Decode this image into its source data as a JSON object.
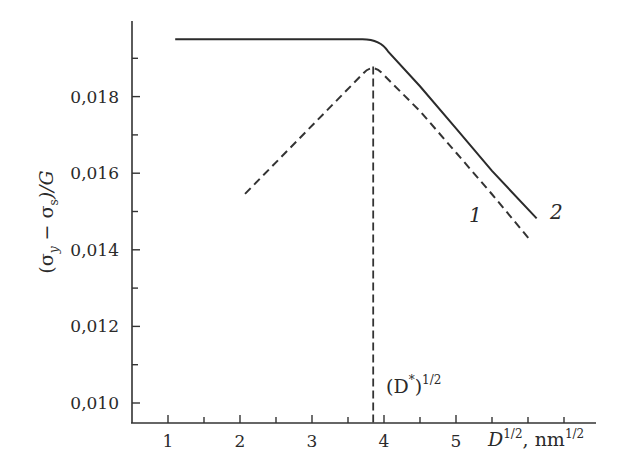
{
  "chart_data": {
    "type": "line",
    "title": "",
    "xlabel": "D^{1/2}, nm^{1/2}",
    "xlabel_parts": {
      "main": "D",
      "main_sup": "1/2",
      "sep": ", nm",
      "unit_sup": "1/2"
    },
    "ylabel": "(σ_y − σ_s)/G",
    "ylabel_parts": {
      "open": "(σ",
      "sub1": "y",
      "minus": " − σ",
      "sub2": "s",
      "close": ")/G"
    },
    "xlim": [
      0.5,
      6.9
    ],
    "ylim": [
      0.0095,
      0.0199
    ],
    "x_ticks": [
      1,
      2,
      3,
      4,
      5
    ],
    "x_tick_labels": [
      "1",
      "2",
      "3",
      "4",
      "5"
    ],
    "x_minor_ticks": [
      1.5,
      2.5,
      3.5,
      4.5,
      5.5,
      6.0,
      6.5
    ],
    "y_ticks": [
      0.01,
      0.012,
      0.014,
      0.016,
      0.018
    ],
    "y_tick_labels": [
      "0,010",
      "0,012",
      "0,014",
      "0,016",
      "0,018"
    ],
    "y_minor_ticks": [
      0.011,
      0.013,
      0.015,
      0.017,
      0.019
    ],
    "grid": false,
    "legend": "none (inline curve labels)",
    "series": [
      {
        "name": "1",
        "style": "dashed",
        "x": [
          2.07,
          3.0,
          3.85,
          4.5,
          5.0,
          5.5,
          6.04
        ],
        "y": [
          0.01546,
          0.01723,
          0.01884,
          0.01762,
          0.01654,
          0.01545,
          0.01423
        ]
      },
      {
        "name": "2",
        "style": "solid",
        "x": [
          1.1,
          2.0,
          3.0,
          3.7,
          4.0,
          4.5,
          5.0,
          5.5,
          6.12
        ],
        "y": [
          0.0195,
          0.0195,
          0.0195,
          0.0195,
          0.01926,
          0.01827,
          0.01717,
          0.01606,
          0.01482
        ]
      }
    ],
    "annotations": [
      {
        "text": "(D*)^{1/2}",
        "x": 3.85,
        "description": "vertical dashed line from peak of curve 1 down to x-axis"
      },
      {
        "text": "1",
        "attached_to": "series 1"
      },
      {
        "text": "2",
        "attached_to": "series 2"
      }
    ]
  },
  "labels": {
    "curve1": "1",
    "curve2": "2",
    "dstar_open": "(D",
    "dstar_star": "*",
    "dstar_close": ")",
    "dstar_sup": "1/2"
  }
}
